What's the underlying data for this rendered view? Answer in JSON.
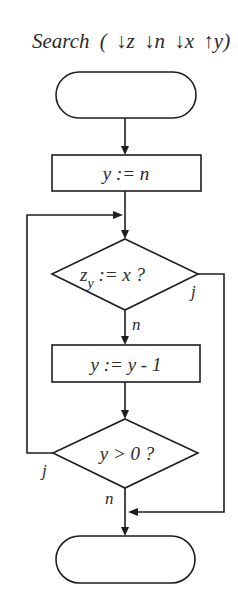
{
  "title": {
    "name": "Search",
    "open": "(",
    "params": [
      {
        "dir": "in",
        "arrow": "↓",
        "name": "z"
      },
      {
        "dir": "in",
        "arrow": "↓",
        "name": "n"
      },
      {
        "dir": "in",
        "arrow": "↓",
        "name": "x"
      },
      {
        "dir": "out",
        "arrow": "↑",
        "name": "y"
      }
    ],
    "close": ")"
  },
  "nodes": {
    "start": {
      "type": "terminal",
      "text": ""
    },
    "init": {
      "type": "process",
      "text": "y := n"
    },
    "check_match": {
      "type": "decision",
      "base": "z",
      "sub": "y",
      "rest": " := x ?",
      "yes_label": "j",
      "no_label": "n"
    },
    "decrement": {
      "type": "process",
      "text": "y := y - 1"
    },
    "check_positive": {
      "type": "decision",
      "text": "y > 0 ?",
      "yes_label": "j",
      "no_label": "n"
    },
    "end": {
      "type": "terminal",
      "text": ""
    }
  },
  "colors": {
    "stroke": "#1e1e1e",
    "text": "#2a2a2a",
    "background": "#ffffff"
  }
}
